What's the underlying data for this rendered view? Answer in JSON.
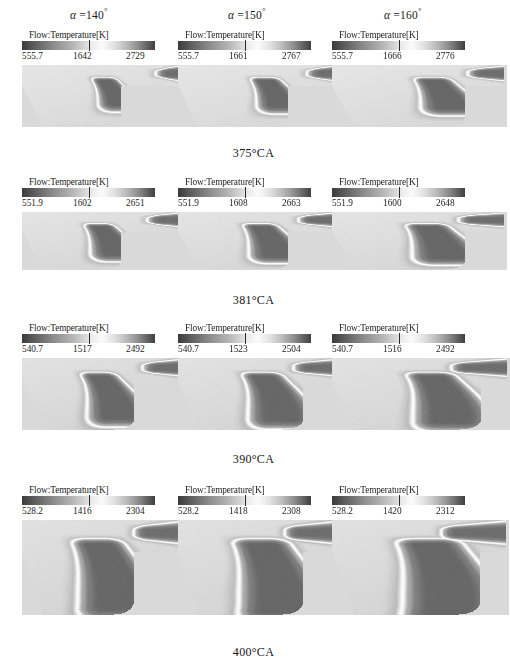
{
  "figure": {
    "column_headers": [
      {
        "symbol": "α",
        "eq": " =",
        "value": "140",
        "degree": "°"
      },
      {
        "symbol": "α",
        "eq": " =",
        "value": "150",
        "degree": "°"
      },
      {
        "symbol": "α",
        "eq": " =",
        "value": "160",
        "degree": "°"
      }
    ],
    "row_captions": [
      "375°CA",
      "381°CA",
      "390°CA",
      "400°CA"
    ],
    "legend_title": "Flow:Temperature[K]"
  },
  "chart_data": {
    "type": "heatmap",
    "xlabel": "",
    "ylabel": "",
    "colormap": "grayscale-banded",
    "grid": false,
    "legend_position": "above-each-panel",
    "columns": [
      "α =140°",
      "α =150°",
      "α =160°"
    ],
    "rows": [
      "375°CA",
      "381°CA",
      "390°CA",
      "400°CA"
    ],
    "panels": [
      {
        "row": "375°CA",
        "cells": [
          {
            "column": "α =140°",
            "legend_title": "Flow:Temperature[K]",
            "min": 555.7,
            "mid": 1642,
            "max": 2729,
            "ticks": [
              "555.7",
              "1642",
              "2729"
            ],
            "units": "K"
          },
          {
            "column": "α =150°",
            "legend_title": "Flow:Temperature[K]",
            "min": 555.7,
            "mid": 1661,
            "max": 2767,
            "ticks": [
              "555.7",
              "1661",
              "2767"
            ],
            "units": "K"
          },
          {
            "column": "α =160°",
            "legend_title": "Flow:Temperature[K]",
            "min": 555.7,
            "mid": 1666,
            "max": 2776,
            "ticks": [
              "555.7",
              "1666",
              "2776"
            ],
            "units": "K"
          }
        ]
      },
      {
        "row": "381°CA",
        "cells": [
          {
            "column": "α =140°",
            "legend_title": "Flow:Temperature[K]",
            "min": 551.9,
            "mid": 1602,
            "max": 2651,
            "ticks": [
              "551.9",
              "1602",
              "2651"
            ],
            "units": "K"
          },
          {
            "column": "α =150°",
            "legend_title": "Flow:Temperature[K]",
            "min": 551.9,
            "mid": 1608,
            "max": 2663,
            "ticks": [
              "551.9",
              "1608",
              "2663"
            ],
            "units": "K"
          },
          {
            "column": "α =160°",
            "legend_title": "Flow:Temperature[K]",
            "min": 551.9,
            "mid": 1600,
            "max": 2648,
            "ticks": [
              "551.9",
              "1600",
              "2648"
            ],
            "units": "K"
          }
        ]
      },
      {
        "row": "390°CA",
        "cells": [
          {
            "column": "α =140°",
            "legend_title": "Flow:Temperature[K]",
            "min": 540.7,
            "mid": 1517,
            "max": 2492,
            "ticks": [
              "540.7",
              "1517",
              "2492"
            ],
            "units": "K"
          },
          {
            "column": "α =150°",
            "legend_title": "Flow:Temperature[K]",
            "min": 540.7,
            "mid": 1523,
            "max": 2504,
            "ticks": [
              "540.7",
              "1523",
              "2504"
            ],
            "units": "K"
          },
          {
            "column": "α =160°",
            "legend_title": "Flow:Temperature[K]",
            "min": 540.7,
            "mid": 1516,
            "max": 2492,
            "ticks": [
              "540.7",
              "1516",
              "2492"
            ],
            "units": "K"
          }
        ]
      },
      {
        "row": "400°CA",
        "cells": [
          {
            "column": "α =140°",
            "legend_title": "Flow:Temperature[K]",
            "min": 528.2,
            "mid": 1416,
            "max": 2304,
            "ticks": [
              "528.2",
              "1416",
              "2304"
            ],
            "units": "K"
          },
          {
            "column": "α =150°",
            "legend_title": "Flow:Temperature[K]",
            "min": 528.2,
            "mid": 1418,
            "max": 2308,
            "ticks": [
              "528.2",
              "1418",
              "2308"
            ],
            "units": "K"
          },
          {
            "column": "α =160°",
            "legend_title": "Flow:Temperature[K]",
            "min": 528.2,
            "mid": 1420,
            "max": 2312,
            "ticks": [
              "528.2",
              "1420",
              "2312"
            ],
            "units": "K"
          }
        ]
      }
    ]
  },
  "render_geometry": {
    "panel_sizes": [
      [
        [
          160,
          62
        ],
        [
          160,
          62
        ],
        [
          175,
          62
        ]
      ],
      [
        [
          160,
          58
        ],
        [
          160,
          58
        ],
        [
          175,
          58
        ]
      ],
      [
        [
          165,
          72
        ],
        [
          165,
          72
        ],
        [
          178,
          72
        ]
      ],
      [
        [
          165,
          95
        ],
        [
          165,
          95
        ],
        [
          177,
          95
        ]
      ]
    ]
  }
}
